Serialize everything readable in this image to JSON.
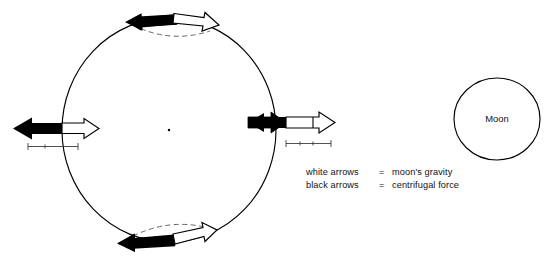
{
  "figure": {
    "type": "physics-diagram",
    "background_color": "#ffffff",
    "ink_color": "#000000"
  },
  "earth": {
    "label": "",
    "center_dot_visible": true,
    "outline_color": "#000000"
  },
  "moon": {
    "label": "Moon",
    "outline_color": "#000000"
  },
  "legend": {
    "rows": [
      {
        "arrow_kind": "white arrows",
        "equals": "=",
        "meaning": "moon's gravity"
      },
      {
        "arrow_kind": "black arrows",
        "equals": "=",
        "meaning": "centrifugal force"
      }
    ]
  },
  "arrows": {
    "near_side": {
      "black_label": "centrifugal force",
      "black_direction": "left",
      "white_label": "moon's gravity",
      "white_direction": "right"
    },
    "far_side": {
      "black_label": "centrifugal force",
      "black_direction": "left",
      "white_label": "moon's gravity",
      "white_direction": "right"
    },
    "top": {
      "black_label": "centrifugal force",
      "black_direction": "left",
      "white_label": "moon's gravity",
      "white_direction": "right"
    },
    "bottom": {
      "black_label": "centrifugal force",
      "black_direction": "left",
      "white_label": "moon's gravity",
      "white_direction": "right"
    }
  }
}
